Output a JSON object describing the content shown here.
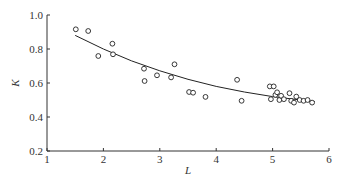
{
  "chart_data": {
    "type": "scatter",
    "title": "",
    "xlabel": "L",
    "ylabel": "K",
    "xlim": [
      1,
      6
    ],
    "ylim": [
      0.2,
      1.0
    ],
    "xticks": [
      "1",
      "2",
      "3",
      "4",
      "5",
      "6"
    ],
    "yticks": [
      "0.2",
      "0.4",
      "0.6",
      "0.8",
      "1.0"
    ],
    "grid": false,
    "legend": null,
    "series": [
      {
        "name": "observations",
        "marker": "open-circle",
        "points": [
          [
            1.51,
            0.916
          ],
          [
            1.73,
            0.906
          ],
          [
            1.91,
            0.759
          ],
          [
            2.16,
            0.831
          ],
          [
            2.17,
            0.769
          ],
          [
            2.72,
            0.684
          ],
          [
            2.73,
            0.612
          ],
          [
            2.95,
            0.645
          ],
          [
            3.2,
            0.633
          ],
          [
            3.26,
            0.71
          ],
          [
            3.52,
            0.547
          ],
          [
            3.59,
            0.543
          ],
          [
            3.81,
            0.518
          ],
          [
            4.37,
            0.619
          ],
          [
            4.45,
            0.495
          ],
          [
            4.95,
            0.58
          ],
          [
            5.02,
            0.58
          ],
          [
            4.97,
            0.505
          ],
          [
            5.05,
            0.53
          ],
          [
            5.08,
            0.545
          ],
          [
            5.12,
            0.5
          ],
          [
            5.15,
            0.525
          ],
          [
            5.2,
            0.505
          ],
          [
            5.3,
            0.54
          ],
          [
            5.33,
            0.495
          ],
          [
            5.38,
            0.485
          ],
          [
            5.42,
            0.52
          ],
          [
            5.48,
            0.5
          ],
          [
            5.55,
            0.495
          ],
          [
            5.62,
            0.5
          ],
          [
            5.7,
            0.485
          ]
        ]
      },
      {
        "name": "fitted curve",
        "type": "line",
        "points": [
          [
            1.5,
            0.88
          ],
          [
            2.0,
            0.8
          ],
          [
            2.5,
            0.73
          ],
          [
            3.0,
            0.672
          ],
          [
            3.5,
            0.622
          ],
          [
            4.0,
            0.58
          ],
          [
            4.5,
            0.547
          ],
          [
            5.0,
            0.52
          ],
          [
            5.5,
            0.5
          ],
          [
            5.75,
            0.49
          ]
        ]
      }
    ]
  }
}
